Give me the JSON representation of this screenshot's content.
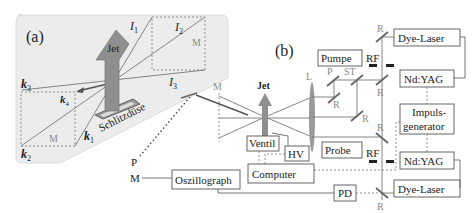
{
  "figure": {
    "panel_a": {
      "label": "(a)",
      "jet_label": "Jet",
      "nozzle_label": "Schlitzdüse",
      "beams": [
        "k1",
        "k2",
        "k3",
        "k4"
      ],
      "signals": [
        "I1",
        "I2",
        "I3"
      ],
      "mask_labels": [
        "M",
        "M"
      ],
      "background_color": "#ececec"
    },
    "panel_b": {
      "label": "(b)",
      "jet_label": "Jet",
      "mask_label": "M",
      "lens_label": "L",
      "polarizer_label": "P",
      "beamsplitter_label": "ST",
      "mirror_label": "R",
      "filter_label": "RF",
      "boxes": {
        "pumpe": "Pumpe",
        "probe": "Probe",
        "dye_laser_top": "Dye-Laser",
        "ndyag_top": "Nd:YAG",
        "impulsgenerator_line1": "Impuls-",
        "impulsgenerator_line2": "generator",
        "ndyag_bottom": "Nd:YAG",
        "dye_laser_bottom": "Dye-Laser",
        "ventil": "Ventil",
        "hv": "HV",
        "computer": "Computer",
        "oszillograph": "Oszillograph",
        "pd": "PD"
      },
      "pm_labels": [
        "P",
        "M"
      ]
    }
  }
}
